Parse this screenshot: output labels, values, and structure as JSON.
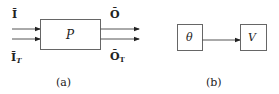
{
  "diagram_a": {
    "caption": "(a)",
    "process_label": "P",
    "inputs": [
      {
        "label": "Ī",
        "subscript": ""
      },
      {
        "label": "Ī",
        "subscript": "T"
      }
    ],
    "outputs": [
      {
        "label": "Ō",
        "subscript": ""
      },
      {
        "label": "Ō",
        "subscript": "T"
      }
    ]
  },
  "diagram_b": {
    "caption": "(b)",
    "source_label": "θ",
    "target_label": "V"
  },
  "colors": {
    "stroke": "#555555",
    "text": "#222222",
    "background": "#ffffff"
  }
}
